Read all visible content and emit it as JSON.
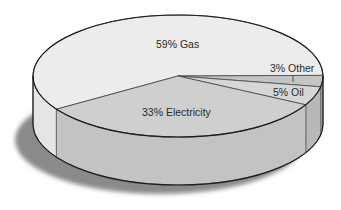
{
  "chart_data": {
    "type": "pie",
    "style": "3d",
    "title": "",
    "categories": [
      "Gas",
      "Electricity",
      "Oil",
      "Other"
    ],
    "values": [
      59,
      33,
      5,
      3
    ],
    "unit": "%",
    "labels": [
      "59% Gas",
      "33% Electricity",
      "5% Oil",
      "3% Other"
    ],
    "colors": {
      "Gas": "#ececec",
      "Electricity": "#cfcfcf",
      "Oil": "#d6d6d6",
      "Other": "#c4c4c4"
    },
    "legend": "none",
    "grid": false
  },
  "labels": {
    "gas": "59% Gas",
    "electricity": "33% Electricity",
    "oil": "5% Oil",
    "other": "3% Other"
  }
}
